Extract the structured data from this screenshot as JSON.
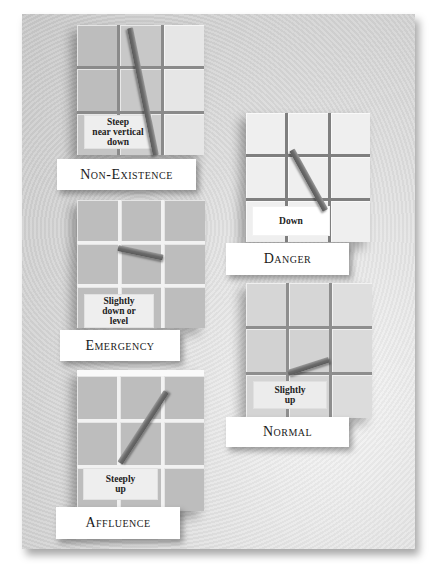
{
  "diagram": {
    "type": "condition-trend-indicators",
    "conditions": [
      {
        "id": "non-existence",
        "label": "Non-Existence",
        "trend": "Steep near vertical down",
        "trend_lines": [
          "Steep",
          "near vertical",
          "down"
        ]
      },
      {
        "id": "danger",
        "label": "Danger",
        "trend": "Down",
        "trend_lines": [
          "Down"
        ]
      },
      {
        "id": "emergency",
        "label": "Emergency",
        "trend": "Slightly down or level",
        "trend_lines": [
          "Slightly",
          "down or",
          "level"
        ]
      },
      {
        "id": "normal",
        "label": "Normal",
        "trend": "Slightly up",
        "trend_lines": [
          "Slightly",
          "up"
        ]
      },
      {
        "id": "affluence",
        "label": "Affluence",
        "trend": "Steeply up",
        "trend_lines": [
          "Steeply",
          "up"
        ]
      }
    ]
  },
  "colors": {
    "background": "#ffffff",
    "panel": "#d9d9d9",
    "label_box": "#ffffff",
    "trend_line": "#6a6a6a",
    "text": "#1a1a1a"
  }
}
